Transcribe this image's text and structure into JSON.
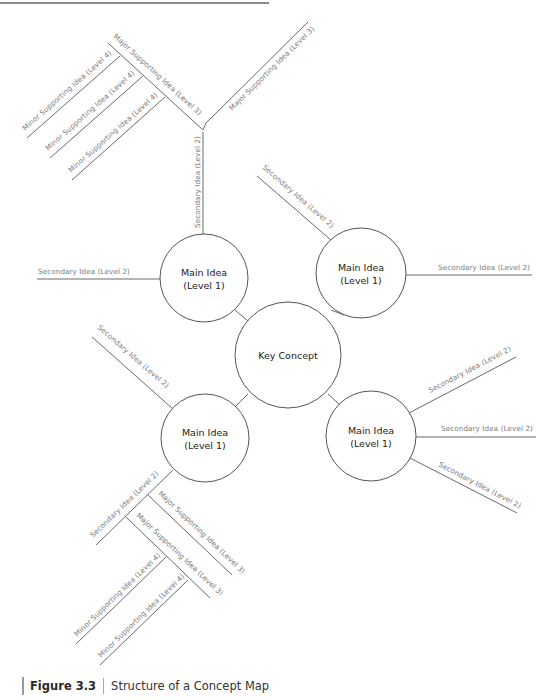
{
  "figure": {
    "number": "Figure 3.3",
    "title": "Structure of a Concept Map"
  },
  "colors": {
    "line": "#6a6a6a",
    "circle_stroke": "#555555",
    "label_text": "#7a7a7a",
    "node_text": "#222222",
    "caption_bar": "#9a9a9a"
  },
  "center": {
    "label": "Key Concept"
  },
  "main_ideas": [
    {
      "position": "top-left",
      "line1": "Main Idea",
      "line2": "(Level 1)"
    },
    {
      "position": "top-right",
      "line1": "Main Idea",
      "line2": "(Level 1)"
    },
    {
      "position": "bottom-left",
      "line1": "Main Idea",
      "line2": "(Level 1)"
    },
    {
      "position": "bottom-right",
      "line1": "Main Idea",
      "line2": "(Level 1)"
    }
  ],
  "branches": {
    "top_left": {
      "secondary_vertical": "Secondary Idea (Level 2)",
      "secondary_left": "Secondary Idea (Level 2)",
      "major_left": "Major Supporting Idea (Level 3)",
      "major_right": "Major Supporting Idea (Level 3)",
      "minor": [
        "Minor Supporting Idea (Level 4)",
        "Minor Supporting Idea (Level 4)",
        "Minor Supporting Idea (Level 4)"
      ]
    },
    "top_right": {
      "secondary_diag": "Secondary Idea (Level 2)",
      "secondary_right": "Secondary Idea (Level 2)"
    },
    "bottom_left": {
      "secondary_upper": "Secondary Idea (Level 2)",
      "secondary_lower": "Secondary Idea (Level 2)",
      "major": [
        "Major Supporting Idea (Level 3)",
        "Major Supporting Idea (Level 3)"
      ],
      "minor": [
        "Minor Supporting Idea (Level 4)",
        "Minor Supporting Idea (Level 4)"
      ]
    },
    "bottom_right": {
      "secondary": [
        "Secondary Idea (Level 2)",
        "Secondary Idea (Level 2)",
        "Secondary Idea (Level 2)"
      ]
    }
  }
}
